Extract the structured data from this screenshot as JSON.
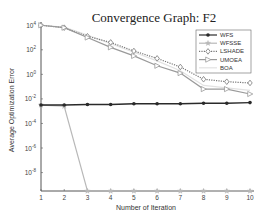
{
  "chart_data": {
    "type": "line",
    "title": "Convergence Graph: F2",
    "xlabel": "Number of Iteration",
    "ylabel": "Average Optimization Error",
    "x": [
      1,
      2,
      3,
      4,
      5,
      6,
      7,
      8,
      9,
      10
    ],
    "xlim": [
      1,
      10
    ],
    "yscale": "log",
    "ylim_exponent": [
      -9.5,
      4.1
    ],
    "yticks": [
      "10^4",
      "10^2",
      "10^0",
      "10^-2",
      "10^-4",
      "10^-6",
      "10^-8"
    ],
    "ytick_exponents": [
      4,
      2,
      0,
      -2,
      -4,
      -6,
      -8
    ],
    "xticks": [
      "1",
      "2",
      "3",
      "4",
      "5",
      "6",
      "7",
      "8",
      "9",
      "10"
    ],
    "grid": false,
    "legend_position": "upper right",
    "series": [
      {
        "name": "WFS",
        "color": "#2a2a2a",
        "style": "solid",
        "marker": "dot",
        "log10_values": [
          -2.5,
          -2.5,
          -2.45,
          -2.45,
          -2.4,
          -2.4,
          -2.4,
          -2.35,
          -2.35,
          -2.3
        ]
      },
      {
        "name": "WFSSE",
        "color": "#b8b8b8",
        "style": "solid",
        "marker": "star",
        "log10_values": [
          -2.5,
          -2.6,
          -9.5,
          -9.5,
          -9.5,
          -9.5,
          -9.5,
          -9.5,
          -9.5,
          -9.5
        ]
      },
      {
        "name": "LSHADE",
        "color": "#777777",
        "style": "dotted",
        "marker": "diamond",
        "log10_values": [
          4.0,
          3.8,
          3.1,
          2.6,
          1.9,
          1.3,
          0.6,
          -0.4,
          -0.6,
          -0.7
        ]
      },
      {
        "name": "UMOEA",
        "color": "#9a9a9a",
        "style": "solid",
        "marker": "triangle-right",
        "log10_values": [
          4.0,
          3.8,
          3.0,
          2.2,
          1.5,
          0.7,
          0.1,
          -1.2,
          -1.2,
          -1.6
        ]
      },
      {
        "name": "BOA",
        "color": "#e2e2e2",
        "style": "solid",
        "marker": "none",
        "log10_values": [
          4.0,
          3.85,
          3.2,
          2.5,
          1.8,
          1.1,
          0.3,
          -0.9,
          -1.1,
          -1.3
        ]
      }
    ]
  }
}
